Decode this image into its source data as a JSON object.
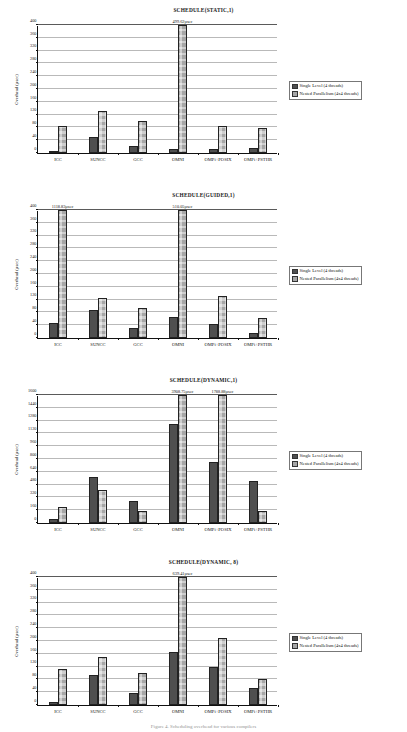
{
  "document": {
    "caption": "Figure 4. Scheduling overhead for various compilers"
  },
  "legend": {
    "series": [
      {
        "name": "Single Level (4 threads)",
        "color": "#4f4f4f"
      },
      {
        "name": "Nested Parallelism (4x4 threads)",
        "color": "#a6a6a6"
      }
    ]
  },
  "axis": {
    "ylabel": "Overhead (µsec)"
  },
  "chart_data": [
    {
      "type": "bar",
      "title": "SCHEDULE(STATIC,1)",
      "xlabel": "",
      "ylabel": "Overhead (µsec)",
      "categories": [
        "ICC",
        "SUNCC",
        "GCC",
        "OMNI",
        "OMPi+POSIX",
        "OMPi+PSTHR"
      ],
      "yticks": [
        0,
        40,
        80,
        120,
        160,
        200,
        240,
        280,
        320,
        360,
        400
      ],
      "ylim": [
        0,
        400
      ],
      "grid": true,
      "legend_position": "right",
      "series": [
        {
          "name": "Single Level (4 threads)",
          "values": [
            2,
            50,
            21,
            14,
            13,
            15
          ]
        },
        {
          "name": "Nested Parallelism (4x4 threads)",
          "values": [
            85,
            131,
            101,
            499.62,
            83,
            77
          ]
        }
      ],
      "annotations": [
        {
          "text": "499.62µsec",
          "category": "OMNI",
          "series": "Nested Parallelism (4x4 threads)"
        }
      ]
    },
    {
      "type": "bar",
      "title": "SCHEDULE(GUIDED,1)",
      "xlabel": "",
      "ylabel": "Overhead (µsec)",
      "categories": [
        "ICC",
        "SUNCC",
        "GCC",
        "OMNI",
        "OMPi+POSIX",
        "OMPi+PSTHR"
      ],
      "yticks": [
        0,
        40,
        80,
        120,
        160,
        200,
        240,
        280,
        320,
        360,
        400
      ],
      "ylim": [
        0,
        400
      ],
      "grid": true,
      "legend_position": "right",
      "series": [
        {
          "name": "Single Level (4 threads)",
          "values": [
            48,
            88,
            31,
            66,
            45,
            16
          ]
        },
        {
          "name": "Nested Parallelism (4x4 threads)",
          "values": [
            1118.83,
            125,
            95,
            510.05,
            131,
            61
          ]
        }
      ],
      "annotations": [
        {
          "text": "1118.83µsec",
          "category": "ICC",
          "series": "Nested Parallelism (4x4 threads)"
        },
        {
          "text": "510.05µsec",
          "category": "OMNI",
          "series": "Nested Parallelism (4x4 threads)"
        }
      ]
    },
    {
      "type": "bar",
      "title": "SCHEDULE(DYNAMIC,1)",
      "xlabel": "",
      "ylabel": "Overhead (µsec)",
      "categories": [
        "ICC",
        "SUNCC",
        "GCC",
        "OMNI",
        "OMPi+POSIX",
        "OMPi+PSTHR"
      ],
      "yticks": [
        0,
        160,
        320,
        480,
        640,
        800,
        960,
        1120,
        1280,
        1440,
        1600
      ],
      "ylim": [
        0,
        1600
      ],
      "grid": true,
      "legend_position": "right",
      "series": [
        {
          "name": "Single Level (4 threads)",
          "values": [
            48,
            570,
            270,
            1240,
            760,
            520
          ]
        },
        {
          "name": "Nested Parallelism (4x4 threads)",
          "values": [
            205,
            410,
            150,
            3908.75,
            1788.88,
            150
          ]
        }
      ],
      "annotations": [
        {
          "text": "3908.75µsec",
          "category": "OMNI",
          "series": "Nested Parallelism (4x4 threads)"
        },
        {
          "text": "1788.88µsec",
          "category": "OMPi+POSIX",
          "series": "Nested Parallelism (4x4 threads)"
        }
      ]
    },
    {
      "type": "bar",
      "title": "SCHEDULE(DYNAMIC, 8)",
      "xlabel": "",
      "ylabel": "Overhead (µsec)",
      "categories": [
        "ICC",
        "SUNCC",
        "GCC",
        "OMNI",
        "OMPi+POSIX",
        "OMPi+PSTHR"
      ],
      "yticks": [
        0,
        40,
        80,
        120,
        160,
        200,
        240,
        280,
        320,
        360,
        400
      ],
      "ylim": [
        0,
        400
      ],
      "grid": true,
      "legend_position": "right",
      "series": [
        {
          "name": "Single Level (4 threads)",
          "values": [
            10,
            94,
            36,
            167,
            118,
            54
          ]
        },
        {
          "name": "Nested Parallelism (4x4 threads)",
          "values": [
            114,
            150,
            99,
            639.41,
            210,
            80
          ]
        }
      ],
      "annotations": [
        {
          "text": "639.41µsec",
          "category": "OMNI",
          "series": "Nested Parallelism (4x4 threads)"
        }
      ]
    }
  ]
}
